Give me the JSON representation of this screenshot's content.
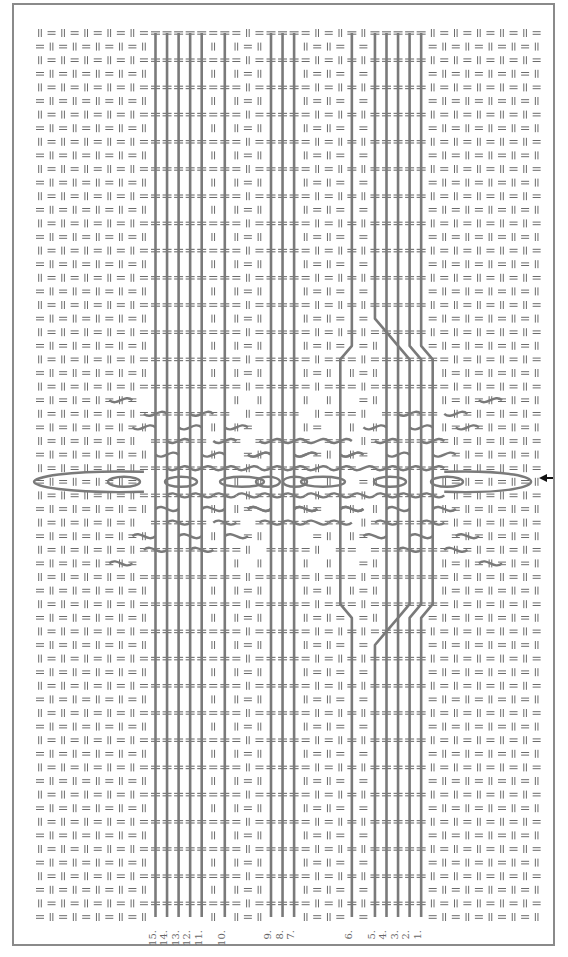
{
  "figure": {
    "type": "tablet-weaving threading diagram",
    "frame_color": "#8a8a8a",
    "thread_color": "#7a7a7a",
    "background_mark_color": "#6a6a6a",
    "background_marks": [
      "||",
      "="
    ],
    "grid": {
      "columns": 44,
      "rows": 66,
      "x0": 40,
      "dx": 11.55,
      "y0": 33,
      "dy": 13.6
    },
    "center_row": 33,
    "arrow": {
      "direction": "left",
      "glyph": "←",
      "y": 478,
      "x": 549
    }
  },
  "threads": [
    {
      "label": "15.",
      "x": 153
    },
    {
      "label": "14.",
      "x": 164
    },
    {
      "label": "13.",
      "x": 176
    },
    {
      "label": "12.",
      "x": 187
    },
    {
      "label": "11.",
      "x": 199
    },
    {
      "label": "10.",
      "x": 222
    },
    {
      "label": "9.",
      "x": 268
    },
    {
      "label": "8.",
      "x": 280
    },
    {
      "label": "7.",
      "x": 291
    },
    {
      "label": "6.",
      "x": 349
    },
    {
      "label": "5.",
      "x": 372
    },
    {
      "label": "4.",
      "x": 383
    },
    {
      "label": "3.",
      "x": 395
    },
    {
      "label": "2.",
      "x": 406
    },
    {
      "label": "1.",
      "x": 418
    }
  ],
  "center_section": {
    "left_edge_x": 40,
    "right_edge_x": 523,
    "lenses": [
      {
        "cx": 124,
        "rx": 16
      },
      {
        "cx": 181,
        "rx": 16
      },
      {
        "cx": 242,
        "rx": 22
      },
      {
        "cx": 268,
        "rx": 12
      },
      {
        "cx": 295,
        "rx": 12
      },
      {
        "cx": 323,
        "rx": 22
      },
      {
        "cx": 390,
        "rx": 16
      },
      {
        "cx": 447,
        "rx": 16
      }
    ]
  }
}
